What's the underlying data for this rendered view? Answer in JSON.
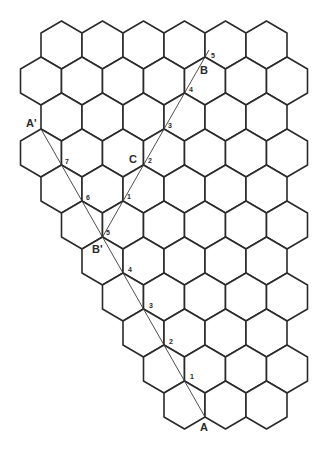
{
  "diagram": {
    "colors": {
      "background": "#ffffff",
      "hex_stroke": "#2a2a2a",
      "line_stroke": "#3a3a3a",
      "label": "#2a2a2a"
    },
    "grid": {
      "orientation": "pointy-top",
      "radius": 24,
      "col_spacing": 41,
      "row_spacing": 36,
      "row0_center_y": 45,
      "even_row_x0": 61.5,
      "odd_row_x0": 41,
      "rows": [
        {
          "row": 0,
          "k_from": 0,
          "k_to": 5
        },
        {
          "row": 1,
          "k_from": 0,
          "k_to": 6
        },
        {
          "row": 2,
          "k_from": 0,
          "k_to": 5
        },
        {
          "row": 3,
          "k_from": 0,
          "k_to": 6
        },
        {
          "row": 4,
          "k_from": 0,
          "k_to": 5
        },
        {
          "row": 5,
          "k_from": 1,
          "k_to": 6
        },
        {
          "row": 6,
          "k_from": 1,
          "k_to": 5
        },
        {
          "row": 7,
          "k_from": 2,
          "k_to": 6
        },
        {
          "row": 8,
          "k_from": 2,
          "k_to": 5
        },
        {
          "row": 9,
          "k_from": 3,
          "k_to": 6
        },
        {
          "row": 10,
          "k_from": 3,
          "k_to": 5
        }
      ]
    },
    "points": {
      "A": {
        "x": 205,
        "y": 417,
        "label": "A",
        "label_x": 200,
        "label_y": 431
      },
      "A_prime": {
        "x": 41,
        "y": 129,
        "label": "A'",
        "label_x": 26,
        "label_y": 127
      },
      "B": {
        "x": 205,
        "y": 57,
        "label": "B",
        "label_x": 200,
        "label_y": 74
      },
      "B_prime": {
        "x": 102.5,
        "y": 237,
        "label": "B'",
        "label_x": 92,
        "label_y": 253
      },
      "C": {
        "x": 143.5,
        "y": 165,
        "label": "C",
        "label_x": 129,
        "label_y": 163
      }
    },
    "lines": [
      {
        "name": "line-a-to-a-prime",
        "from": [
          205,
          417
        ],
        "to": [
          41,
          129
        ]
      },
      {
        "name": "line-b-prime-to-b",
        "from": [
          102.5,
          237
        ],
        "to": [
          209,
          50
        ]
      }
    ],
    "step_labels": [
      {
        "path": "A-A'",
        "text": "1",
        "x": 190,
        "y": 379
      },
      {
        "path": "A-A'",
        "text": "2",
        "x": 169,
        "y": 344
      },
      {
        "path": "A-A'",
        "text": "3",
        "x": 149,
        "y": 308
      },
      {
        "path": "A-A'",
        "text": "4",
        "x": 128,
        "y": 272
      },
      {
        "path": "A-A'",
        "text": "5",
        "x": 106,
        "y": 235
      },
      {
        "path": "A-A'",
        "text": "6",
        "x": 86,
        "y": 200
      },
      {
        "path": "A-A'",
        "text": "7",
        "x": 65,
        "y": 164
      },
      {
        "path": "B'-B",
        "text": "1",
        "x": 127,
        "y": 199
      },
      {
        "path": "B'-B",
        "text": "2",
        "x": 148,
        "y": 163
      },
      {
        "path": "B'-B",
        "text": "3",
        "x": 168,
        "y": 128
      },
      {
        "path": "B'-B",
        "text": "4",
        "x": 189,
        "y": 92
      },
      {
        "path": "B'-B",
        "text": "5",
        "x": 211,
        "y": 58
      }
    ]
  }
}
